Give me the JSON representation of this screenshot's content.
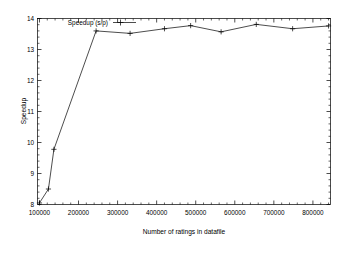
{
  "chart_data": {
    "type": "line",
    "title": "",
    "xlabel": "Number of ratings in datafile",
    "ylabel": "Speedup",
    "xlim": [
      95000,
      845000
    ],
    "ylim": [
      8,
      14
    ],
    "grid": false,
    "legend_position": "top-left-inside",
    "xticks": [
      100000,
      200000,
      300000,
      400000,
      500000,
      600000,
      700000,
      800000
    ],
    "xticklabels": [
      "100000",
      "200000",
      "300000",
      "400000",
      "500000",
      "600000",
      "700000",
      "800000"
    ],
    "yticks": [
      8,
      9,
      10,
      11,
      12,
      13,
      14
    ],
    "yticklabels": [
      "8",
      "9",
      "10",
      "11",
      "12",
      "13",
      "14"
    ],
    "series": [
      {
        "name": "Speedup (s/p)",
        "marker": "plus",
        "color": "#000000",
        "x": [
          100000,
          123000,
          137000,
          245000,
          332000,
          420000,
          487000,
          565000,
          655000,
          748000,
          840000
        ],
        "values": [
          8.05,
          8.5,
          9.78,
          13.6,
          13.52,
          13.67,
          13.77,
          13.57,
          13.81,
          13.67,
          13.76
        ]
      }
    ]
  },
  "legend": {
    "entries": [
      {
        "label": "Speedup (s/p)"
      }
    ]
  }
}
